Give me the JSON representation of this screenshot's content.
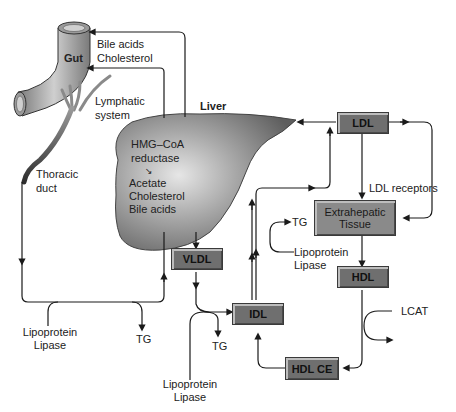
{
  "organs": {
    "gut": "Gut",
    "liver": "Liver",
    "lymphatic": [
      "Lymphatic",
      "system"
    ],
    "thoracic": [
      "Thoracic",
      "duct"
    ]
  },
  "liver_pathway": {
    "enzyme": [
      "HMG–CoA",
      "reductase"
    ],
    "acetate": "Acetate",
    "cholesterol": "Cholesterol",
    "bile_acids": "Bile acids"
  },
  "gut_inputs": [
    "Bile acids",
    "Cholesterol"
  ],
  "lipoproteins": {
    "vldl": "VLDL",
    "idl": "IDL",
    "ldl": "LDL",
    "hdl": "HDL",
    "hdl_ce": "HDL CE",
    "extrahepatic": [
      "Extrahepatic",
      "Tissue"
    ]
  },
  "labels": {
    "ldl_receptors": "LDL receptors",
    "lcat": "LCAT",
    "tg_left": "TG",
    "tg_middle": "TG",
    "tg_right": "TG",
    "lipase_left": [
      "Lipoprotein",
      "Lipase"
    ],
    "lipase_middle": [
      "Lipoprotein",
      "Lipase"
    ],
    "lipase_right": [
      "Lipoprotein",
      "Lipase"
    ]
  },
  "colors": {
    "box_fill": "#6f6f6f",
    "box_light_fill": "#8a8a8a",
    "organ_fill": "#8c8c8c",
    "line": "#1a1a1a"
  }
}
